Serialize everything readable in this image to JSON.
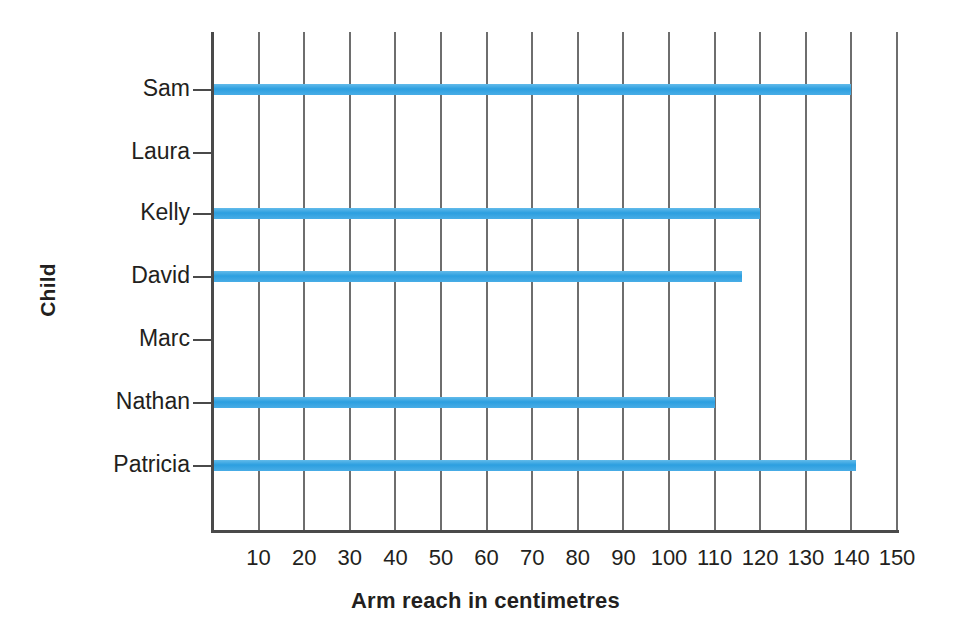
{
  "chart_data": {
    "type": "bar",
    "orientation": "horizontal",
    "title": "",
    "xlabel": "Arm reach in centimetres",
    "ylabel": "Child",
    "categories": [
      "Sam",
      "Laura",
      "Kelly",
      "David",
      "Marc",
      "Nathan",
      "Patricia"
    ],
    "values": [
      140,
      0,
      120,
      116,
      0,
      110,
      141
    ],
    "xlim": [
      0,
      150
    ],
    "xticks": [
      10,
      20,
      30,
      40,
      50,
      60,
      70,
      80,
      90,
      100,
      110,
      120,
      130,
      140,
      150
    ],
    "xtick_labels": [
      "10",
      "20",
      "30",
      "40",
      "50",
      "60",
      "70",
      "80",
      "90",
      "100",
      "110",
      "120",
      "130",
      "140",
      "150"
    ],
    "grid": "vertical",
    "legend": "none",
    "bar_color": "#3fa9e5",
    "axis_color": "#4a4a4a",
    "gridline_color": "#6e6e6e"
  },
  "axes": {
    "x_title": "Arm reach in centimetres",
    "y_title": "Child"
  },
  "rows": [
    {
      "label": "Sam",
      "value": 140
    },
    {
      "label": "Laura",
      "value": 0
    },
    {
      "label": "Kelly",
      "value": 120
    },
    {
      "label": "David",
      "value": 116
    },
    {
      "label": "Marc",
      "value": 0
    },
    {
      "label": "Nathan",
      "value": 110
    },
    {
      "label": "Patricia",
      "value": 141
    }
  ]
}
